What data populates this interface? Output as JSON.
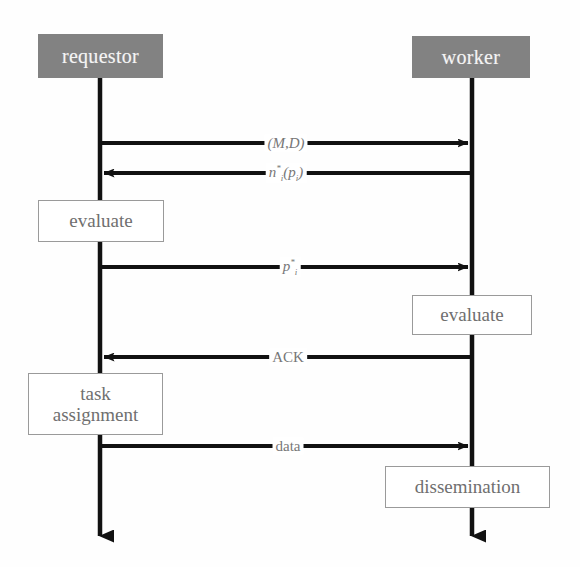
{
  "diagram": {
    "type": "sequence-diagram",
    "title": "",
    "colors": {
      "actor_fill": "#828282",
      "actor_text": "#f4f4f4",
      "box_fill": "#ffffff",
      "box_border": "#9a9a9a",
      "box_text": "#6f6f6f",
      "line": "#111111",
      "label_text": "#777777",
      "background": "#fefefe"
    },
    "actors": [
      {
        "id": "requestor",
        "label": "requestor",
        "x": 100,
        "box": {
          "left": 38,
          "top": 34,
          "width": 125,
          "height": 44
        }
      },
      {
        "id": "worker",
        "label": "worker",
        "x": 472,
        "box": {
          "left": 412,
          "top": 36,
          "width": 118,
          "height": 42
        }
      }
    ],
    "messages": [
      {
        "id": "m1",
        "label": "(M,D)",
        "style": "italic",
        "from": "requestor",
        "to": "worker",
        "direction": "right",
        "y": 143
      },
      {
        "id": "m2",
        "label": "n",
        "sup": "*",
        "sub": "i",
        "tail": "(p",
        "tail_sub": "i",
        "tail_end": ")",
        "label_full": "ni*(pi)",
        "style": "italic",
        "from": "worker",
        "to": "requestor",
        "direction": "left",
        "y": 173
      },
      {
        "id": "m3",
        "label": "p",
        "sup": "*",
        "sub": "i",
        "label_full": "pi*",
        "style": "italic",
        "from": "requestor",
        "to": "worker",
        "direction": "right",
        "y": 267
      },
      {
        "id": "m4",
        "label": "ACK",
        "style": "normal",
        "from": "worker",
        "to": "requestor",
        "direction": "left",
        "y": 357
      },
      {
        "id": "m5",
        "label": "data",
        "style": "normal",
        "from": "requestor",
        "to": "worker",
        "direction": "right",
        "y": 446
      }
    ],
    "action_boxes": [
      {
        "id": "b1",
        "lines": [
          "evaluate"
        ],
        "actor": "requestor",
        "left": 38,
        "top": 200,
        "width": 124,
        "height": 40
      },
      {
        "id": "b2",
        "lines": [
          "evaluate"
        ],
        "actor": "worker",
        "left": 412,
        "top": 295,
        "width": 118,
        "height": 38
      },
      {
        "id": "b3",
        "lines": [
          "task",
          "assignment"
        ],
        "actor": "requestor",
        "left": 28,
        "top": 373,
        "width": 133,
        "height": 60
      },
      {
        "id": "b4",
        "lines": [
          "dissemination"
        ],
        "actor": "worker",
        "left": 385,
        "top": 466,
        "width": 163,
        "height": 40
      }
    ],
    "lifelines": [
      {
        "actor": "requestor",
        "x": 100,
        "top": 78,
        "bottom": 551,
        "terminator": "arrow-down"
      },
      {
        "actor": "worker",
        "x": 472,
        "top": 78,
        "bottom": 551,
        "terminator": "arrow-down"
      }
    ]
  }
}
